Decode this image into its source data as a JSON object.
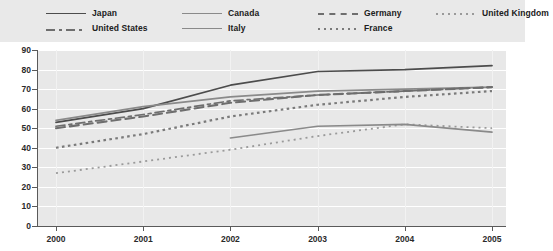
{
  "legend": {
    "entries": [
      {
        "label": "Japan",
        "style": "solid-dark",
        "color": "#4c4c4c"
      },
      {
        "label": "Canada",
        "style": "solid-mid",
        "color": "#8a8a8a"
      },
      {
        "label": "Germany",
        "style": "dashed",
        "color": "#6e6e6e"
      },
      {
        "label": "United Kingdom",
        "style": "dotted-fine",
        "color": "#9a9a9a"
      },
      {
        "label": "United States",
        "style": "dashdot",
        "color": "#6e6e6e"
      },
      {
        "label": "Italy",
        "style": "solid-mid2",
        "color": "#8a8a8a"
      },
      {
        "label": "France",
        "style": "dotted",
        "color": "#7a7a7a"
      },
      {
        "label": "",
        "style": "none",
        "color": "transparent"
      }
    ]
  },
  "chart_data": {
    "type": "line",
    "title": "",
    "xlabel": "",
    "ylabel": "",
    "categories": [
      "2000",
      "2001",
      "2002",
      "2003",
      "2004",
      "2005"
    ],
    "x": [
      2000,
      2001,
      2002,
      2003,
      2004,
      2005
    ],
    "ylim": [
      0,
      90
    ],
    "yticks": [
      0,
      10,
      20,
      30,
      40,
      50,
      60,
      70,
      80,
      90
    ],
    "ytick_labels": [
      "0",
      "10",
      "20",
      "30",
      "40",
      "50",
      "60",
      "70",
      "80",
      "90"
    ],
    "xlim": [
      2000,
      2005
    ],
    "grid": true,
    "legend_position": "top",
    "series": [
      {
        "name": "Japan",
        "style": "solid-dark",
        "color": "#4c4c4c",
        "values": [
          53,
          60,
          72,
          79,
          80,
          82
        ]
      },
      {
        "name": "Canada",
        "style": "solid-mid",
        "color": "#8a8a8a",
        "values": [
          54,
          61,
          66,
          69,
          70,
          71
        ]
      },
      {
        "name": "Germany",
        "style": "dashed",
        "color": "#6e6e6e",
        "values": [
          50,
          56,
          63,
          67,
          69,
          71
        ]
      },
      {
        "name": "United States",
        "style": "dashdot",
        "color": "#6e6e6e",
        "values": [
          51,
          57,
          64,
          67,
          69,
          71
        ]
      },
      {
        "name": "France",
        "style": "dotted",
        "color": "#7a7a7a",
        "values": [
          40,
          47,
          56,
          62,
          66,
          69
        ]
      },
      {
        "name": "United Kingdom",
        "style": "dotted-fine",
        "color": "#9a9a9a",
        "values": [
          27,
          33,
          39,
          46,
          52,
          50
        ]
      },
      {
        "name": "Italy",
        "style": "solid-mid2",
        "color": "#8a8a8a",
        "values": [
          null,
          null,
          45,
          51,
          52,
          48
        ]
      }
    ]
  }
}
